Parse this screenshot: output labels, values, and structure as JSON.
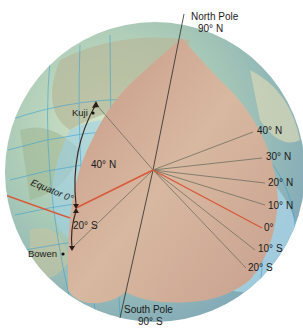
{
  "diagram": {
    "poles": {
      "north": {
        "name": "North Pole",
        "value": "90° N"
      },
      "south": {
        "name": "South Pole",
        "value": "90° S"
      }
    },
    "cities": [
      {
        "name": "Kuji"
      },
      {
        "name": "Bowen"
      }
    ],
    "arc_labels": {
      "north": "40° N",
      "south": "20° S"
    },
    "equator_label": "Equator 0°",
    "latitude_labels": [
      "40° N",
      "30° N",
      "20° N",
      "10° N",
      "0°",
      "10° S",
      "20° S"
    ],
    "colors": {
      "wedge": "#c9a08c",
      "ocean": "#a9cfe3",
      "land": "#b9c49a",
      "equator_line": "#d9583a",
      "lat_lines": "#6b6b5c",
      "grid": "#4aa6d6"
    }
  }
}
